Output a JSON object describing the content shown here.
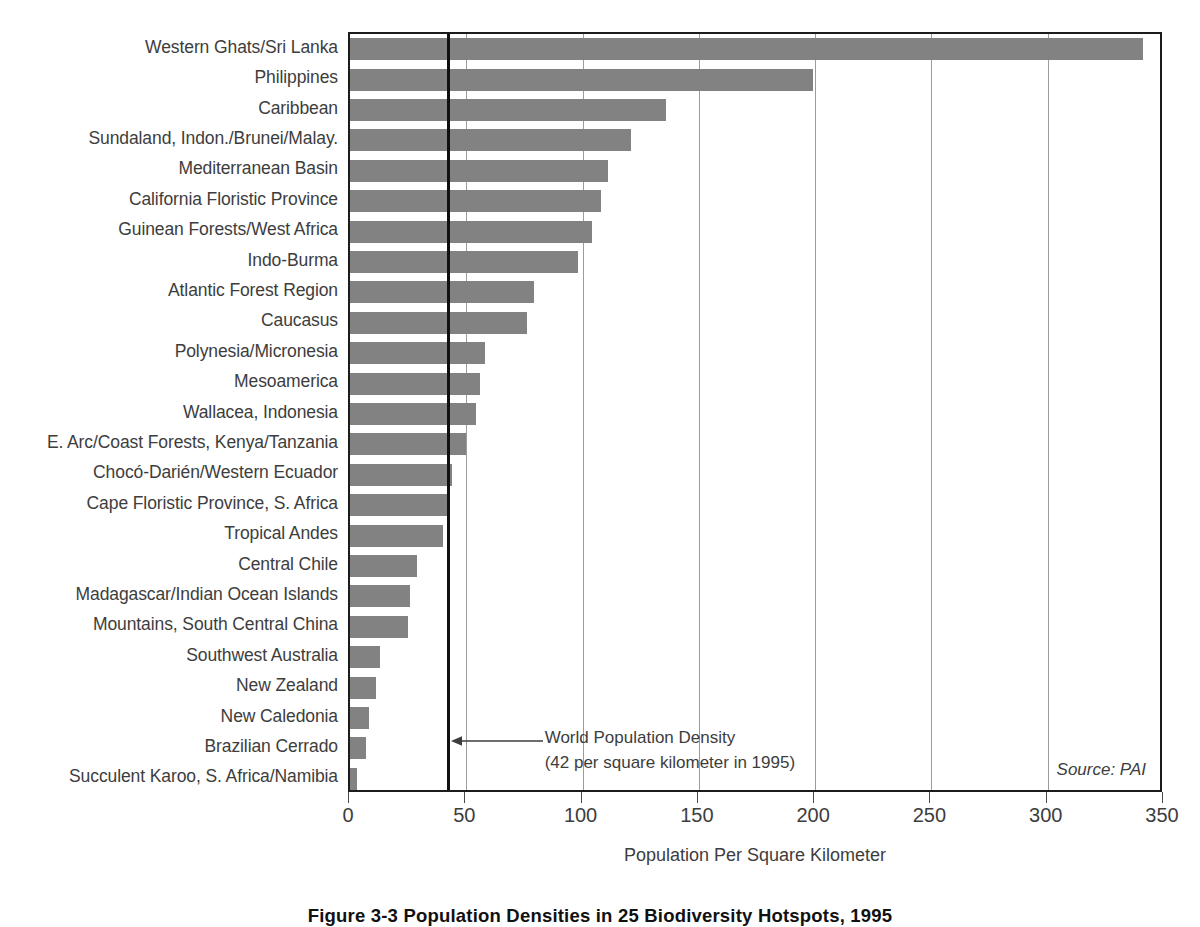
{
  "chart_data": {
    "type": "bar",
    "orientation": "horizontal",
    "title": "Figure 3-3 Population Densities in 25 Biodiversity Hotspots, 1995",
    "xlabel": "Population Per Square Kilometer",
    "ylabel": "",
    "xlim": [
      0,
      350
    ],
    "xticks": [
      0,
      50,
      100,
      150,
      200,
      250,
      300,
      350
    ],
    "xtick_labels": [
      "0",
      "50",
      "100",
      "150",
      "200",
      "250",
      "300",
      "350"
    ],
    "grid": "vertical",
    "legend": "none",
    "bar_color": "#828282",
    "categories": [
      "Western Ghats/Sri Lanka",
      "Philippines",
      "Caribbean",
      "Sundaland, Indon./Brunei/Malay.",
      "Mediterranean Basin",
      "California Floristic Province",
      "Guinean Forests/West Africa",
      "Indo-Burma",
      "Atlantic Forest Region",
      "Caucasus",
      "Polynesia/Micronesia",
      "Mesoamerica",
      "Wallacea, Indonesia",
      "E. Arc/Coast Forests, Kenya/Tanzania",
      "Chocó-Darién/Western Ecuador",
      "Cape Floristic Province, S. Africa",
      "Tropical Andes",
      "Central Chile",
      "Madagascar/Indian Ocean Islands",
      "Mountains, South Central China",
      "Southwest Australia",
      "New Zealand",
      "New Caledonia",
      "Brazilian Cerrado",
      "Succulent Karoo, S. Africa/Namibia"
    ],
    "values": [
      341,
      199,
      136,
      121,
      111,
      108,
      104,
      98,
      79,
      76,
      58,
      56,
      54,
      50,
      44,
      42,
      40,
      29,
      26,
      25,
      13,
      11,
      8,
      7,
      3
    ],
    "annotations": [
      {
        "name": "world-population-density",
        "line1": "World Population Density",
        "line2": "(42 per square kilometer in 1995)",
        "value": 42
      }
    ],
    "source": "Source: PAI"
  }
}
